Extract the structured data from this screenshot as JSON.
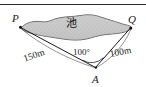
{
  "figure": {
    "points": {
      "P": {
        "label": "P",
        "x": 20,
        "y": 26
      },
      "Q": {
        "label": "Q",
        "x": 131,
        "y": 27
      },
      "A": {
        "label": "A",
        "x": 96,
        "y": 68
      }
    },
    "region": {
      "label": "池",
      "name": "pond",
      "fill_color": "#c9c9c9",
      "stroke_color": "#3a3a3a"
    },
    "measurements": {
      "PA_length": "150m",
      "QA_length": "100m",
      "angle_at_A": "100°"
    },
    "colors": {
      "line": "#1a1a1a",
      "text": "#1a1a1a",
      "background": "#ffffff",
      "rule": "#2b2b2b"
    },
    "top_rule": true
  }
}
